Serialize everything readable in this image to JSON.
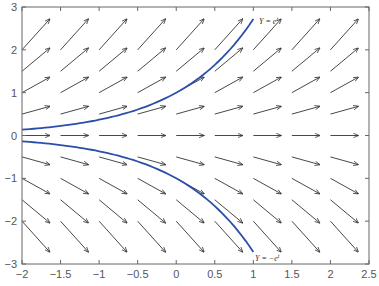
{
  "chart_data": {
    "type": "line",
    "title": "",
    "xlabel": "",
    "ylabel": "",
    "xlim": [
      -2,
      2.5
    ],
    "ylim": [
      -3,
      3
    ],
    "grid": false,
    "x_ticks": [
      -2,
      -1.5,
      -1,
      -0.5,
      0,
      0.5,
      1,
      1.5,
      2,
      2.5
    ],
    "x_tick_labels": [
      "−2",
      "−1.5",
      "−1",
      "−0.5",
      "0",
      "0.5",
      "1",
      "1.5",
      "2",
      "2.5"
    ],
    "y_ticks": [
      -3,
      -2,
      -1,
      0,
      1,
      2,
      3
    ],
    "y_tick_labels": [
      "−3",
      "−2",
      "−1",
      "0",
      "1",
      "2",
      "3"
    ],
    "slope_field": {
      "equation": "dY/dt = Y",
      "x_points": [
        -2,
        -1.5,
        -1,
        -0.5,
        0,
        0.5,
        1,
        1.5,
        2
      ],
      "y_points": [
        2,
        1.5,
        1,
        0.5,
        0,
        -0.5,
        -1,
        -1.5,
        -2
      ],
      "arrow_color": "#333333"
    },
    "series": [
      {
        "name": "Y = e^t",
        "label": "Y = e",
        "label_sup": "t",
        "color": "#2a4fa8",
        "t_range": [
          -2,
          1
        ],
        "x": [
          -2,
          -1.5,
          -1,
          -0.5,
          0,
          0.5,
          1
        ],
        "values": [
          0.135,
          0.223,
          0.368,
          0.607,
          1.0,
          1.649,
          2.718
        ]
      },
      {
        "name": "Y = -e^t",
        "label": "Y = −e",
        "label_sup": "t",
        "color": "#2a4fa8",
        "t_range": [
          -2,
          1
        ],
        "x": [
          -2,
          -1.5,
          -1,
          -0.5,
          0,
          0.5,
          1
        ],
        "values": [
          -0.135,
          -0.223,
          -0.368,
          -0.607,
          -1.0,
          -1.649,
          -2.718
        ]
      }
    ]
  }
}
